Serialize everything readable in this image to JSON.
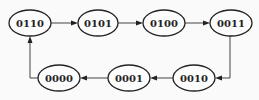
{
  "diagram": {
    "type": "state-transition-cycle",
    "colors": {
      "background": "#fafafa",
      "node_stroke": "#222222",
      "node_fill": "#fcfcfc",
      "edge": "#444444",
      "text": "#222222"
    },
    "nodes": [
      {
        "id": "n0110",
        "label": "0110",
        "cx": 30,
        "cy": 23,
        "rx": 21,
        "ry": 13
      },
      {
        "id": "n0101",
        "label": "0101",
        "cx": 98,
        "cy": 23,
        "rx": 20,
        "ry": 13
      },
      {
        "id": "n0100",
        "label": "0100",
        "cx": 164,
        "cy": 23,
        "rx": 21,
        "ry": 13
      },
      {
        "id": "n0011",
        "label": "0011",
        "cx": 231,
        "cy": 23,
        "rx": 21,
        "ry": 13
      },
      {
        "id": "n0010",
        "label": "0010",
        "cx": 194,
        "cy": 78,
        "rx": 21,
        "ry": 13
      },
      {
        "id": "n0001",
        "label": "0001",
        "cx": 129,
        "cy": 78,
        "rx": 21,
        "ry": 13
      },
      {
        "id": "n0000",
        "label": "0000",
        "cx": 59,
        "cy": 78,
        "rx": 21,
        "ry": 13
      }
    ],
    "edges": [
      {
        "from": "0110",
        "to": "0101"
      },
      {
        "from": "0101",
        "to": "0100"
      },
      {
        "from": "0100",
        "to": "0011"
      },
      {
        "from": "0011",
        "to": "0010"
      },
      {
        "from": "0010",
        "to": "0001"
      },
      {
        "from": "0001",
        "to": "0000"
      },
      {
        "from": "0000",
        "to": "0110"
      }
    ]
  }
}
